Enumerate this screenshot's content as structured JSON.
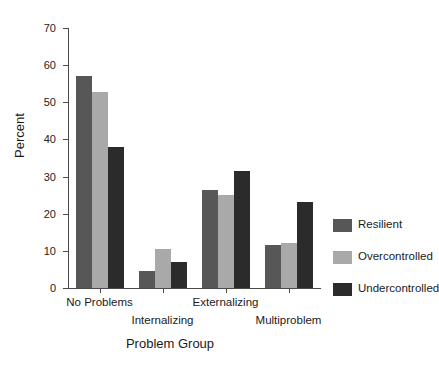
{
  "chart_data": {
    "type": "bar",
    "title": "",
    "xlabel": "Problem Group",
    "ylabel": "Percent",
    "categories": [
      "No Problems",
      "Internalizing",
      "Externalizing",
      "Multiproblem"
    ],
    "series": [
      {
        "name": "Resilient",
        "color": "#575757",
        "values": [
          57.0,
          4.5,
          26.5,
          11.5
        ]
      },
      {
        "name": "Overcontrolled",
        "color": "#a9a9a9",
        "values": [
          52.7,
          10.5,
          25.0,
          12.0
        ]
      },
      {
        "name": "Undercontrolled",
        "color": "#2b2b2b",
        "values": [
          38.0,
          7.0,
          31.5,
          23.2
        ]
      }
    ],
    "ylim": [
      0,
      70
    ],
    "yticks": [
      0,
      10,
      20,
      30,
      40,
      50,
      60,
      70
    ],
    "ytick_labels": [
      "0",
      "10",
      "20",
      "30",
      "40",
      "50",
      "60",
      "70"
    ],
    "grid": false,
    "legend_position": "right"
  },
  "axes": {
    "y_title": "Percent",
    "x_title": "Problem Group"
  }
}
